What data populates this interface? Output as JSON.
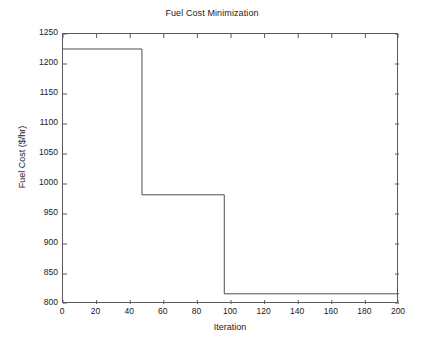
{
  "chart_data": {
    "type": "line",
    "title": "Fuel Cost Minimization",
    "xlabel": "Iteration",
    "ylabel": "Fuel Cost ($/hr)",
    "xlim": [
      0,
      200
    ],
    "ylim": [
      800,
      1250
    ],
    "grid": false,
    "legend": null,
    "line_color": "#4d4d4d",
    "step_style": "post",
    "xticks": [
      0,
      20,
      40,
      60,
      80,
      100,
      120,
      140,
      160,
      180,
      200
    ],
    "xtick_labels": [
      "0",
      "20",
      "40",
      "60",
      "80",
      "100",
      "120",
      "140",
      "160",
      "180",
      "200"
    ],
    "yticks": [
      800,
      850,
      900,
      950,
      1000,
      1050,
      1100,
      1150,
      1200,
      1250
    ],
    "ytick_labels": [
      "800",
      "850",
      "900",
      "950",
      "1000",
      "1050",
      "1100",
      "1150",
      "1200",
      "1250"
    ],
    "series": [
      {
        "name": "Best Fuel Cost",
        "x": [
          0,
          47,
          47,
          96,
          96,
          200
        ],
        "values": [
          1225,
          1225,
          982,
          982,
          817,
          817
        ]
      }
    ],
    "steps": [
      {
        "x_start": 0,
        "x_end": 47,
        "y": 1225
      },
      {
        "x_start": 47,
        "x_end": 96,
        "y": 982
      },
      {
        "x_start": 96,
        "x_end": 200,
        "y": 817
      }
    ]
  }
}
